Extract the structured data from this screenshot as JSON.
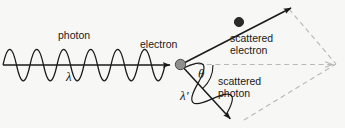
{
  "figure": {
    "background_color": "#f7f7f5",
    "stroke_color": "#1a1a1a",
    "dashed_color": "#b8b8b8",
    "electron_dot_color": "#8c8c8c",
    "scattered_electron_dot_color": "#2b2b2b"
  },
  "labels": {
    "photon": "photon",
    "lambda": "λ",
    "electron": "electron",
    "scattered_electron_line1": "scattered",
    "scattered_electron_line2": "electron",
    "theta": "θ",
    "lambda_prime": "λ'",
    "scattered_photon_line1": "scattered",
    "scattered_photon_line2": "photon"
  },
  "elements": {
    "incident_photon_wave": "incident-photon-wave",
    "incident_photon_arrow": "incident-photon-arrow",
    "electron_dot": "electron-dot",
    "scattered_electron_arrow": "scattered-electron-arrow",
    "scattered_electron_dot": "scattered-electron-dot",
    "scattered_photon_wave": "scattered-photon-wave",
    "scattered_photon_arrow": "scattered-photon-arrow",
    "angle_arc": "angle-arc",
    "dashed_axis": "dashed-axis-arrow",
    "dashed_construction": "dashed-construction-lines"
  }
}
